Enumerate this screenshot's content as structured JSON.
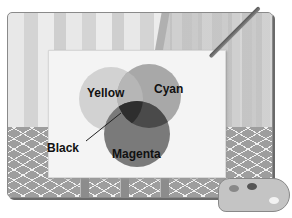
{
  "illustration": {
    "subject": "CMYK subtractive color mixing on an easel canvas",
    "labels": {
      "yellow": "Yellow",
      "cyan": "Cyan",
      "magenta": "Magenta",
      "black": "Black"
    },
    "colors": {
      "yellow": "#d2d2d2",
      "cyan": "#9e9e9e",
      "magenta": "#7a7a7a",
      "black": "#3a3a3a",
      "background": "#ffffff"
    }
  }
}
